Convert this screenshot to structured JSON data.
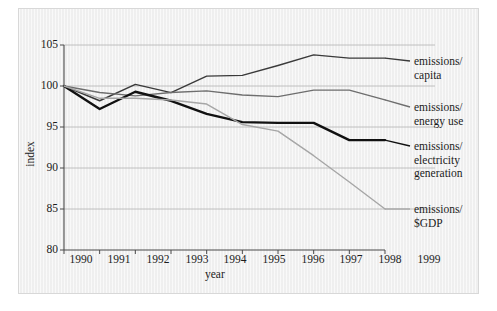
{
  "chart_data": {
    "type": "line",
    "title": "",
    "xlabel": "year",
    "ylabel": "index",
    "x": [
      1990,
      1991,
      1992,
      1993,
      1994,
      1995,
      1996,
      1997,
      1998,
      1999
    ],
    "xtick_labels": [
      "1990",
      "1991",
      "1992",
      "1993",
      "1994",
      "1995",
      "1996",
      "1997",
      "1998",
      "1999"
    ],
    "ytick_labels": [
      "105",
      "100",
      "95",
      "90",
      "85",
      "80"
    ],
    "yticks": [
      105,
      100,
      95,
      90,
      85,
      80
    ],
    "ylim": [
      80,
      105
    ],
    "xlim": [
      1990,
      1999
    ],
    "grid": "horizontal",
    "legend_position": "right-inline-labels",
    "series": [
      {
        "name": "emissions/\ncapita",
        "label": "emissions/\ncapita",
        "color": "#3a3a3a",
        "width": 1.4,
        "values": [
          100.0,
          98.2,
          100.2,
          99.2,
          101.2,
          101.3,
          102.5,
          103.8,
          103.4,
          103.4
        ]
      },
      {
        "name": "emissions/\nenergy use",
        "label": "emissions/\nenergy use",
        "color": "#6e6e6e",
        "width": 1.4,
        "values": [
          100.0,
          99.2,
          98.8,
          99.2,
          99.4,
          98.9,
          98.7,
          99.5,
          99.5,
          98.3
        ]
      },
      {
        "name": "emissions/\nelectricity\ngeneration",
        "label": "emissions/\nelectricity\ngeneration",
        "color": "#111111",
        "width": 2.4,
        "values": [
          100.0,
          97.2,
          99.3,
          98.2,
          96.6,
          95.6,
          95.5,
          95.5,
          93.4,
          93.4
        ]
      },
      {
        "name": "emissions/\n$GDP",
        "label": "emissions/\n$GDP",
        "color": "#a6a6a6",
        "width": 1.4,
        "values": [
          100.0,
          98.5,
          98.5,
          98.3,
          97.8,
          95.3,
          94.5,
          91.5,
          88.3,
          85.0
        ]
      }
    ]
  },
  "axes": {
    "ylabel": "index",
    "xlabel": "year",
    "yticks": [
      {
        "label": "105"
      },
      {
        "label": "100"
      },
      {
        "label": "95"
      },
      {
        "label": "90"
      },
      {
        "label": "85"
      },
      {
        "label": "80"
      }
    ],
    "xticks": [
      {
        "label": "1990"
      },
      {
        "label": "1991"
      },
      {
        "label": "1992"
      },
      {
        "label": "1993"
      },
      {
        "label": "1994"
      },
      {
        "label": "1995"
      },
      {
        "label": "1996"
      },
      {
        "label": "1997"
      },
      {
        "label": "1998"
      },
      {
        "label": "1999"
      }
    ]
  },
  "legend": {
    "items": [
      {
        "label": "emissions/\ncapita",
        "color": "#3a3a3a"
      },
      {
        "label": "emissions/\nenergy use",
        "color": "#6e6e6e"
      },
      {
        "label": "emissions/\nelectricity\ngeneration",
        "color": "#111111"
      },
      {
        "label": "emissions/\n$GDP",
        "color": "#a6a6a6"
      }
    ]
  },
  "colors": {
    "panel_background": "#f2f2f2",
    "page_background": "#ffffff",
    "gridline": "#b9b9b9",
    "axis": "#4a4a4a",
    "text": "#1c1c1c"
  }
}
